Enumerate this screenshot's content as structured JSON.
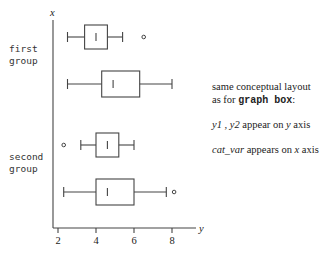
{
  "chart_data": {
    "type": "boxplot-horizontal",
    "title": "",
    "xlabel": "y",
    "ylabel": "x",
    "xlim": [
      2,
      9
    ],
    "x_ticks": [
      2,
      4,
      6,
      8
    ],
    "groups": [
      {
        "label": "first group",
        "label_lines": [
          "first",
          "group"
        ],
        "boxes": [
          {
            "whisker_low": 2.5,
            "q1": 3.4,
            "median": 4.0,
            "q3": 4.6,
            "whisker_high": 5.4,
            "outliers": [
              6.3
            ]
          },
          {
            "whisker_low": 2.5,
            "q1": 4.3,
            "median": 4.9,
            "q3": 6.3,
            "whisker_high": 8.0,
            "outliers": []
          }
        ]
      },
      {
        "label": "second group",
        "label_lines": [
          "second",
          "group"
        ],
        "boxes": [
          {
            "whisker_low": 3.2,
            "q1": 4.0,
            "median": 4.6,
            "q3": 5.2,
            "whisker_high": 6.0,
            "outliers": [
              2.3
            ]
          },
          {
            "whisker_low": 2.3,
            "q1": 4.0,
            "median": 4.6,
            "q3": 6.0,
            "whisker_high": 7.7,
            "outliers": [
              7.9
            ]
          }
        ]
      }
    ],
    "grid": false,
    "legend": null
  },
  "axis": {
    "y_label": "x",
    "x_label": "y",
    "ticks": [
      "2",
      "4",
      "6",
      "8"
    ]
  },
  "group_labels": [
    {
      "line1": "first",
      "line2": "group"
    },
    {
      "line1": "second",
      "line2": "group"
    }
  ],
  "notes": {
    "line1": "same conceptual layout",
    "line2_pre": "as for ",
    "line2_code": "graph box",
    "line2_post": ":",
    "line3_vars": "y1 ,  y2",
    "line3_mid": "  appear on ",
    "line3_axis": "y",
    "line3_post": " axis",
    "line4_var": "cat_var",
    "line4_mid": "  appears on ",
    "line4_axis": "x",
    "line4_post": " axis"
  },
  "colors": {
    "stroke": "#444444",
    "text": "#222222"
  }
}
